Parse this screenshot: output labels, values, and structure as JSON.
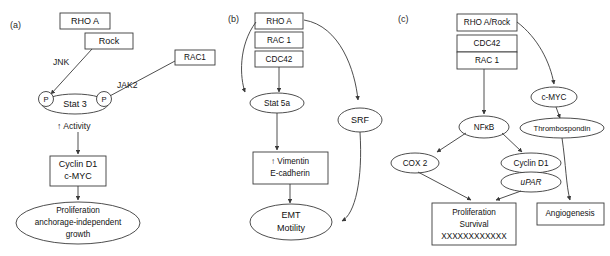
{
  "figure": {
    "background": "#ffffff",
    "stroke_color": "#3a3a3a",
    "text_color": "#111111",
    "width": 610,
    "height": 256
  },
  "panels": [
    {
      "id": "a",
      "label": "(a)",
      "nodes": {
        "rhoa": "RHO A",
        "rock": "Rock",
        "rac1": "RAC1",
        "p_left": "P",
        "p_right": "P",
        "stat3": "Stat 3",
        "activity": "↑ Activity",
        "cyclin_d1": "Cyclin D1",
        "cmyc": "c-MYC",
        "outcome_line1": "Proliferation",
        "outcome_line2": "anchorage-independent",
        "outcome_line3": "growth"
      },
      "edge_labels": {
        "jnk": "JNK",
        "jak2": "JAK2"
      }
    },
    {
      "id": "b",
      "label": "(b)",
      "nodes": {
        "rhoa": "RHO A",
        "rac1": "RAC 1",
        "cdc42": "CDC42",
        "stat5a": "Stat 5a",
        "srf": "SRF",
        "vimentin": "↑ Vimentin",
        "ecadherin": "E-cadherin",
        "emt": "EMT",
        "motility": "Motility"
      }
    },
    {
      "id": "c",
      "label": "(c)",
      "nodes": {
        "rhoa_rock": "RHO A/Rock",
        "cdc42": "CDC42",
        "rac1": "RAC 1",
        "cmyc": "c-MYC",
        "thrombospondin": "Thrombospondin",
        "nfkb": "NFκB",
        "cox2": "COX 2",
        "cyclin_d1": "Cyclin D1",
        "upar": "uPAR",
        "outcome_line1": "Proliferation",
        "outcome_line2": "Survival",
        "outcome_line3": "XXXXXXXXXXXX",
        "angiogenesis": "Angiogenesis"
      }
    }
  ]
}
